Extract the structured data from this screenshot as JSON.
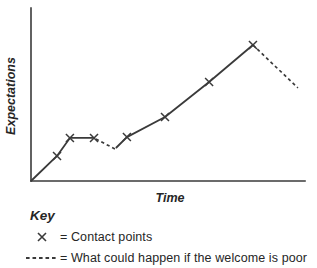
{
  "chart_data": {
    "type": "line",
    "xlabel": "Time",
    "ylabel": "Expectations",
    "xlim": [
      0,
      100
    ],
    "ylim": [
      0,
      100
    ],
    "grid": false,
    "series": [
      {
        "name": "initial-rise",
        "style": "solid",
        "points": [
          [
            0,
            0
          ],
          [
            9.5,
            14.5
          ],
          [
            14.2,
            24.9
          ],
          [
            23,
            24.9
          ]
        ]
      },
      {
        "name": "poor-welcome-dip",
        "style": "dashed",
        "points": [
          [
            23.7,
            24.3
          ],
          [
            30.7,
            18.5
          ]
        ]
      },
      {
        "name": "recovery-climb",
        "style": "solid",
        "points": [
          [
            31,
            19.1
          ],
          [
            35,
            25.4
          ],
          [
            48.9,
            37
          ],
          [
            65,
            57.2
          ],
          [
            81,
            78.6
          ]
        ]
      },
      {
        "name": "poor-welcome-fall",
        "style": "dashed",
        "points": [
          [
            81,
            78.6
          ],
          [
            97.4,
            53.8
          ]
        ]
      }
    ],
    "contact_points": [
      [
        9.5,
        14.5
      ],
      [
        14.2,
        24.9
      ],
      [
        23,
        24.9
      ],
      [
        35,
        25.4
      ],
      [
        48.9,
        37
      ],
      [
        65,
        57.2
      ],
      [
        81,
        78.6
      ]
    ]
  },
  "key": {
    "title": "Key",
    "items": [
      {
        "symbol": "x-marker",
        "label": "= Contact points"
      },
      {
        "symbol": "dashed-line",
        "label": "= What could happen if the welcome is poor"
      }
    ]
  },
  "colors": {
    "ink": "#3a3a3a",
    "text": "#262626",
    "background": "#ffffff"
  }
}
